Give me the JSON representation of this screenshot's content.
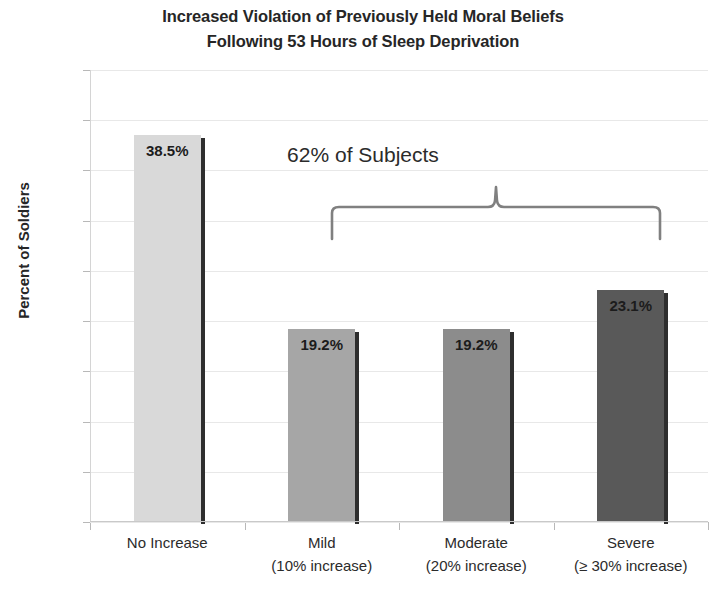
{
  "chart_data": {
    "type": "bar",
    "title": "Increased Violation of Previously Held Moral Beliefs Following 53 Hours of Sleep Deprivation",
    "title_line1": "Increased Violation of Previously Held Moral Beliefs",
    "title_line2": "Following 53 Hours of Sleep Deprivation",
    "xlabel": "",
    "ylabel": "Percent of Soldiers",
    "ylim": [
      0,
      45
    ],
    "ytick_labels": [
      "45%",
      "40%",
      "35%",
      "30%",
      "25%",
      "20%",
      "15%",
      "10%",
      "5%",
      "0%"
    ],
    "ytick_values": [
      45,
      40,
      35,
      30,
      25,
      20,
      15,
      10,
      5,
      0
    ],
    "grid": true,
    "legend": "none",
    "categories": [
      "No Increase",
      "Mild",
      "Moderate",
      "Severe"
    ],
    "category_sublabels": [
      "",
      "(10% increase)",
      "(20% increase)",
      "(≥ 30% increase)"
    ],
    "values": [
      38.5,
      19.2,
      19.2,
      23.1
    ],
    "value_labels": [
      "38.5%",
      "19.2%",
      "19.2%",
      "23.1%"
    ],
    "bar_colors": [
      "#d9d9d9",
      "#a6a6a6",
      "#8c8c8c",
      "#595959"
    ],
    "annotations": [
      {
        "text": "62% of Subjects",
        "type": "bracket-label",
        "covers": [
          "Mild",
          "Moderate",
          "Severe"
        ]
      }
    ]
  }
}
